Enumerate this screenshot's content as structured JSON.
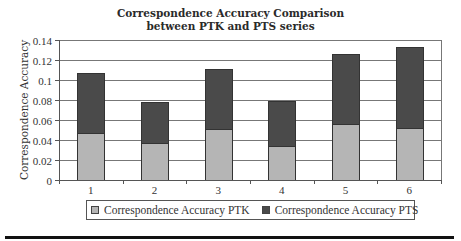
{
  "chart_data": {
    "type": "bar",
    "stacked": true,
    "title": "Correspondence Accuracy Comparison between PTK and PTS series",
    "title_lines": [
      "Correspondence Accuracy Comparison",
      "between PTK and PTS series"
    ],
    "xlabel": "",
    "ylabel": "Correspondence Accuracy",
    "categories": [
      "1",
      "2",
      "3",
      "4",
      "5",
      "6"
    ],
    "series": [
      {
        "name": "Correspondence Accuracy PTK",
        "color": "#b5b5b5",
        "values": [
          0.047,
          0.037,
          0.051,
          0.034,
          0.056,
          0.052
        ]
      },
      {
        "name": "Correspondence Accuracy PTS",
        "color": "#4a4a4a",
        "values": [
          0.06,
          0.041,
          0.06,
          0.045,
          0.07,
          0.081
        ]
      }
    ],
    "totals": [
      0.107,
      0.078,
      0.111,
      0.079,
      0.126,
      0.133
    ],
    "ylim": [
      0,
      0.14
    ],
    "yticks": [
      "0",
      "0.02",
      "0.04",
      "0.06",
      "0.08",
      "0.1",
      "0.12",
      "0.14"
    ],
    "grid": true,
    "legend_position": "bottom"
  }
}
